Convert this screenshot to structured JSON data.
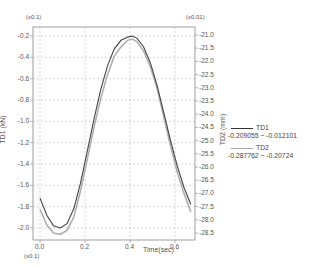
{
  "chart_data": {
    "type": "line",
    "title": "",
    "xlabel": "Time(sec)",
    "x_multiplier": "(x0.1)",
    "ylabel_left": "TD1  (kN)",
    "y_left_multiplier": "(x0.1)",
    "ylabel_right": "TD2  (mm)",
    "y_right_multiplier": "(x0.01)",
    "xlim": [
      -0.01,
      0.69
    ],
    "ylim_left": [
      -2.12,
      -0.13
    ],
    "ylim_right": [
      -28.8,
      -20.8
    ],
    "grid": true,
    "legend_position": "right",
    "x_ticks": [
      "0.0",
      "0.2",
      "0.4",
      "0.6"
    ],
    "y_left_ticks": [
      "-0.2",
      "-0.4",
      "-0.6",
      "-0.8",
      "-1.0",
      "-1.2",
      "-1.4",
      "-1.6",
      "-1.8",
      "-2.0"
    ],
    "y_right_ticks": [
      "-21.0",
      "-21.5",
      "-22.0",
      "-22.5",
      "-23.0",
      "-23.5",
      "-24.0",
      "-24.5",
      "-25.0",
      "-25.5",
      "-26.0",
      "-26.5",
      "-27.0",
      "-27.5",
      "-28.0",
      "-28.5"
    ],
    "x": [
      0.0,
      0.03,
      0.06,
      0.09,
      0.12,
      0.15,
      0.18,
      0.21,
      0.24,
      0.27,
      0.3,
      0.33,
      0.36,
      0.39,
      0.41,
      0.43,
      0.46,
      0.49,
      0.52,
      0.55,
      0.58,
      0.61,
      0.64,
      0.67
    ],
    "series": [
      {
        "name": "TD1",
        "axis": "left",
        "color": "#444444",
        "range_label_min": "-0.209055",
        "range_label_max": "-0.012101",
        "values": [
          -1.72,
          -1.88,
          -1.98,
          -2.0,
          -1.96,
          -1.82,
          -1.58,
          -1.28,
          -0.98,
          -0.7,
          -0.48,
          -0.32,
          -0.24,
          -0.21,
          -0.2,
          -0.22,
          -0.3,
          -0.45,
          -0.66,
          -0.92,
          -1.18,
          -1.42,
          -1.62,
          -1.78
        ]
      },
      {
        "name": "TD2",
        "axis": "right",
        "color": "#aaaaaa",
        "range_label_min": "-0.287762",
        "range_label_max": "-0.20724",
        "values": [
          -27.6,
          -28.2,
          -28.5,
          -28.55,
          -28.4,
          -27.9,
          -26.9,
          -25.7,
          -24.5,
          -23.4,
          -22.5,
          -21.8,
          -21.45,
          -21.2,
          -21.15,
          -21.25,
          -21.6,
          -22.2,
          -23.0,
          -24.1,
          -25.2,
          -26.2,
          -27.0,
          -27.7
        ]
      }
    ]
  },
  "legend": {
    "items": [
      {
        "label": "TD1",
        "range": "-0.209055  ~  -0.012101"
      },
      {
        "label": "TD2",
        "range": "-0.287762  ~  -0.20724"
      }
    ]
  }
}
